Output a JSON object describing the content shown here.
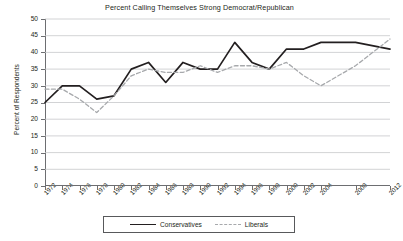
{
  "chart_data": {
    "type": "line",
    "title": "Percent Calling Themselves Strong Democrat/Republican",
    "xlabel": "",
    "ylabel": "Percent of Respondents",
    "ylim": [
      0,
      50
    ],
    "ytick_step": 5,
    "yticks": [
      0,
      5,
      10,
      15,
      20,
      25,
      30,
      35,
      40,
      45,
      50
    ],
    "grid": true,
    "grid_axis": "y",
    "legend_position": "bottom",
    "categories": [
      "1972",
      "1974",
      "1976",
      "1978",
      "1980",
      "1982",
      "1984",
      "1986",
      "1988",
      "1990",
      "1992",
      "1994",
      "1996",
      "1998",
      "2000",
      "2002",
      "2004",
      "2008",
      "2012"
    ],
    "series": [
      {
        "name": "Conservatives",
        "style": "solid",
        "color": "#231f20",
        "values": [
          25,
          30,
          30,
          26,
          27,
          35,
          37,
          31,
          37,
          35,
          35,
          43,
          37,
          35,
          41,
          41,
          43,
          43,
          41
        ]
      },
      {
        "name": "Liberals",
        "style": "dashed",
        "color": "#a7a9ac",
        "values": [
          29,
          29,
          26,
          22,
          27,
          33,
          35,
          34,
          34,
          36,
          34,
          36,
          36,
          35,
          37,
          33,
          30,
          36,
          44
        ]
      }
    ]
  },
  "legend": {
    "entries": [
      {
        "label": "Conservatives"
      },
      {
        "label": "Liberals"
      }
    ]
  }
}
